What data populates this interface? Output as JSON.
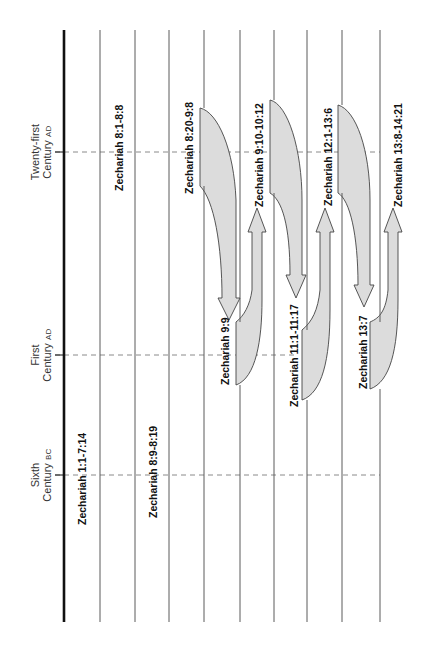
{
  "diagram": {
    "type": "timeline-fulfillment",
    "orientation": "rotated-90-ccw",
    "colors": {
      "axis_line": "#111111",
      "column_line": "#555555",
      "dashed_line": "#888888",
      "arrow_fill": "#dcdcdc",
      "arrow_stroke": "#444444",
      "text": "#111111"
    },
    "eras": [
      {
        "line1": "Twenty-first",
        "line2": "Century",
        "suffix": "AD",
        "y": 152
      },
      {
        "line1": "First",
        "line2": "Century",
        "suffix": "AD",
        "y": 355
      },
      {
        "line1": "Sixth",
        "line2": "Century",
        "suffix": "BC",
        "y": 475
      }
    ],
    "passages": [
      {
        "label": "Zechariah 1:1-7:14",
        "column": 1,
        "era": "Sixth Century BC"
      },
      {
        "label": "Zechariah 8:1-8:8",
        "column": 2,
        "era": "Twenty-first Century AD"
      },
      {
        "label": "Zechariah 8:9-8:19",
        "column": 3,
        "era": "Sixth Century BC"
      },
      {
        "label": "Zechariah 8:20-9:8",
        "column": 4,
        "era": "Twenty-first Century AD"
      },
      {
        "label": "Zechariah 9:9",
        "column": 5,
        "era": "First Century AD"
      },
      {
        "label": "Zechariah 9:10-10:12",
        "column": 6,
        "era": "Twenty-first Century AD"
      },
      {
        "label": "Zechariah 11:1-11:17",
        "column": 7,
        "era": "First Century AD"
      },
      {
        "label": "Zechariah 12:1-13:6",
        "column": 8,
        "era": "Twenty-first Century AD"
      },
      {
        "label": "Zechariah 13:7",
        "column": 9,
        "era": "First Century AD"
      },
      {
        "label": "Zechariah 13:8-14:21",
        "column": 10,
        "era": "Twenty-first Century AD"
      }
    ],
    "arrows": [
      {
        "from": "Zechariah 8:20-9:8",
        "to": "Zechariah 9:9",
        "direction": "down"
      },
      {
        "from": "Zechariah 9:9",
        "to": "Zechariah 9:10-10:12",
        "direction": "up"
      },
      {
        "from": "Zechariah 9:10-10:12",
        "to": "Zechariah 11:1-11:17",
        "direction": "down"
      },
      {
        "from": "Zechariah 11:1-11:17",
        "to": "Zechariah 12:1-13:6",
        "direction": "up"
      },
      {
        "from": "Zechariah 12:1-13:6",
        "to": "Zechariah 13:7",
        "direction": "down"
      },
      {
        "from": "Zechariah 13:7",
        "to": "Zechariah 13:8-14:21",
        "direction": "up"
      }
    ]
  }
}
